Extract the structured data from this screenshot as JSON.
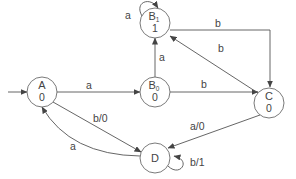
{
  "diagram": {
    "type": "state-machine",
    "initial_state": "A",
    "states": [
      {
        "id": "A",
        "name": "A",
        "subscript": "",
        "output": "0"
      },
      {
        "id": "B1",
        "name": "B",
        "subscript": "1",
        "output": "1"
      },
      {
        "id": "B0",
        "name": "B",
        "subscript": "0",
        "output": "0"
      },
      {
        "id": "C",
        "name": "C",
        "subscript": "",
        "output": "0"
      },
      {
        "id": "D",
        "name": "D",
        "subscript": "",
        "output": ""
      }
    ],
    "transitions": [
      {
        "from": "A",
        "to": "B0",
        "label": "a"
      },
      {
        "from": "A",
        "to": "D",
        "label": "b/0"
      },
      {
        "from": "D",
        "to": "A",
        "label": "a"
      },
      {
        "from": "B0",
        "to": "B1",
        "label": "a"
      },
      {
        "from": "B0",
        "to": "C",
        "label": "b"
      },
      {
        "from": "B1",
        "to": "B1",
        "label": "a"
      },
      {
        "from": "B1",
        "to": "C",
        "label": "b"
      },
      {
        "from": "C",
        "to": "B1",
        "label": "b"
      },
      {
        "from": "C",
        "to": "D",
        "label": "a/0"
      },
      {
        "from": "D",
        "to": "D",
        "label": "b/1"
      }
    ]
  }
}
